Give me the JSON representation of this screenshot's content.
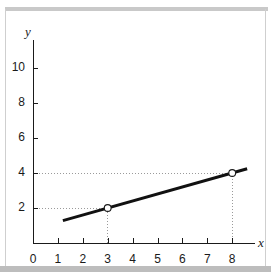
{
  "figure": {
    "background_color": "#ffffff",
    "ink_color": "#1a1a1a",
    "guide_color": "#9a9a9a",
    "scan_bar_color": "#c9c9c9"
  },
  "chart_data": {
    "type": "line",
    "title": "",
    "xlabel": "x",
    "ylabel": "y",
    "xlim": [
      0,
      8.8
    ],
    "ylim": [
      0,
      11.6
    ],
    "grid": false,
    "legend": "none",
    "x_ticks": [
      0,
      1,
      2,
      3,
      4,
      5,
      6,
      7,
      8
    ],
    "x_tick_labels": [
      "0",
      "1",
      "2",
      "3",
      "4",
      "5",
      "6",
      "7",
      "8"
    ],
    "y_ticks": [
      2,
      4,
      6,
      8,
      10
    ],
    "y_tick_labels": [
      "2",
      "4",
      "6",
      "8",
      "10"
    ],
    "series": [
      {
        "name": "line",
        "x": [
          1.2,
          8.6
        ],
        "y": [
          1.28,
          4.24
        ],
        "slope": 0.4,
        "intercept": 0.8,
        "style": "solid",
        "width_px": 3,
        "color": "#111111"
      }
    ],
    "markers": [
      {
        "label": "point-1",
        "x": 3,
        "y": 2,
        "style": "open-circle"
      },
      {
        "label": "point-2",
        "x": 8,
        "y": 4,
        "style": "open-circle"
      }
    ],
    "guide_lines": [
      {
        "label": "guide-h-2",
        "from": [
          0,
          2
        ],
        "to": [
          3,
          2
        ],
        "style": "dotted"
      },
      {
        "label": "guide-v-3",
        "from": [
          3,
          0
        ],
        "to": [
          3,
          2
        ],
        "style": "dotted"
      },
      {
        "label": "guide-h-4",
        "from": [
          0,
          4
        ],
        "to": [
          8,
          4
        ],
        "style": "dotted"
      },
      {
        "label": "guide-v-8",
        "from": [
          8,
          0
        ],
        "to": [
          8,
          4
        ],
        "style": "dotted"
      }
    ],
    "annotations": []
  }
}
